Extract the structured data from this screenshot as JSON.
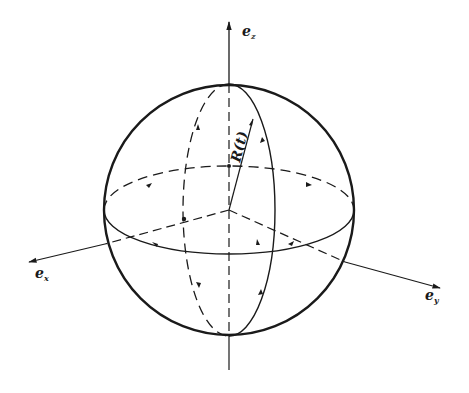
{
  "diagram": {
    "type": "sphere-coordinate-figure",
    "axes": {
      "vertical": {
        "label": "e",
        "subscript": "z"
      },
      "left": {
        "label": "e",
        "subscript": "x"
      },
      "right": {
        "label": "e",
        "subscript": "y"
      }
    },
    "radius_label": "R(t)",
    "colors": {
      "stroke": "#1a1a1a",
      "background": "#ffffff"
    }
  }
}
